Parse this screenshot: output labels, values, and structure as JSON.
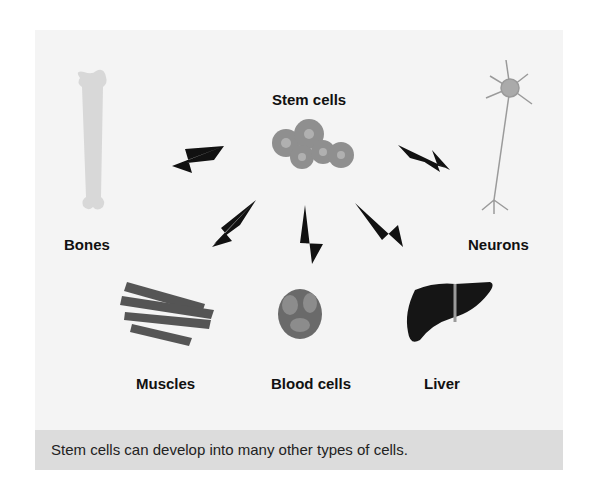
{
  "diagram": {
    "center": {
      "label": "Stem cells"
    },
    "targets": [
      {
        "label": "Bones"
      },
      {
        "label": "Neurons"
      },
      {
        "label": "Muscles"
      },
      {
        "label": "Blood cells"
      },
      {
        "label": "Liver"
      }
    ],
    "caption": "Stem cells can develop into many other types of cells."
  },
  "colors": {
    "panel_bg": "#f4f4f4",
    "caption_bg": "#dcdcdc",
    "arrow": "#111111",
    "cells": "#8a8a8a",
    "bone": "#d8d8d8",
    "liver": "#151515"
  }
}
